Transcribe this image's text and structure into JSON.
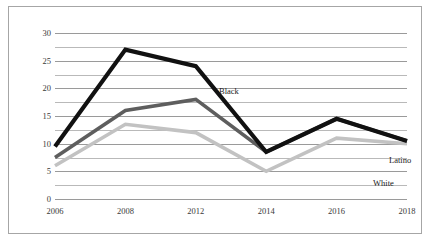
{
  "chart_data": {
    "type": "line",
    "title": "",
    "xlabel": "",
    "ylabel": "",
    "categories": [
      "2006",
      "2008",
      "2012",
      "2014",
      "2016",
      "2018"
    ],
    "ylim": [
      0,
      30
    ],
    "yticks": [
      0,
      5,
      10,
      15,
      20,
      25,
      30
    ],
    "ytick_labels": [
      "0",
      "5",
      "10",
      "15",
      "20",
      "25",
      "30"
    ],
    "minor_gridlines": [
      2.5,
      7.5,
      12.5,
      17.5,
      22.5,
      27.5
    ],
    "grid": true,
    "legend_position": "inline-annotations",
    "series": [
      {
        "name": "Black",
        "color": "#111111",
        "values": [
          9.5,
          27,
          24,
          8.5,
          14.5,
          10.5
        ]
      },
      {
        "name": "Latino",
        "color": "#5e5e5e",
        "values": [
          7.5,
          16,
          18,
          8.5,
          14.5,
          10.5
        ]
      },
      {
        "name": "White",
        "color": "#c2c2c2",
        "values": [
          6,
          13.5,
          12,
          5,
          11,
          10
        ]
      }
    ],
    "annotations": [
      {
        "text": "Black",
        "x_px": 210,
        "y_px": 80
      },
      {
        "text": "Latino",
        "x_px": 380,
        "y_px": 149
      },
      {
        "text": "White",
        "x_px": 364,
        "y_px": 172
      }
    ]
  },
  "colors": {
    "border": "#a6a6a6",
    "gridline_major": "#9a9a9a",
    "gridline_minor": "#b9b9b9",
    "background": "#ffffff",
    "tick_text": "#3a3a3a"
  }
}
